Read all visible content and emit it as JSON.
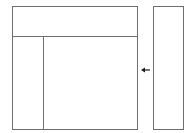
{
  "diagram": {
    "type": "layout-schematic",
    "elements": [
      {
        "id": "main-panel",
        "shape": "rectangle",
        "regions": [
          "header-region",
          "left-column-region",
          "content-region"
        ]
      },
      {
        "id": "side-panel",
        "shape": "rectangle"
      },
      {
        "id": "arrow",
        "from": "side-panel",
        "to": "main-panel",
        "direction": "left"
      }
    ],
    "colors": {
      "stroke": "#6e6e6e",
      "arrow": "#1a1a1a",
      "background": "#ffffff"
    }
  }
}
